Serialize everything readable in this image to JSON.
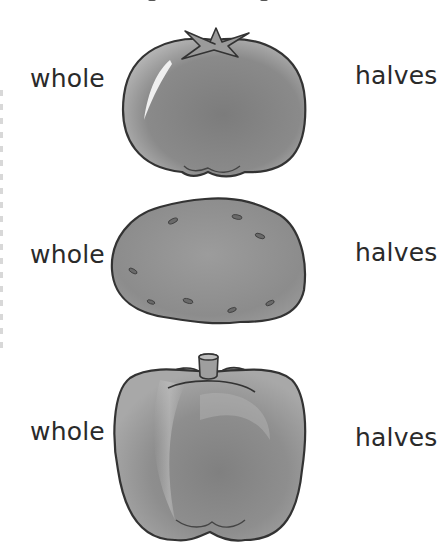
{
  "worksheet": {
    "rows": [
      {
        "item": "tomato",
        "left_label": "whole",
        "right_label": "halves"
      },
      {
        "item": "potato",
        "left_label": "whole",
        "right_label": "halves"
      },
      {
        "item": "bell-pepper",
        "left_label": "whole",
        "right_label": "halves"
      }
    ],
    "colors": {
      "background": "#ffffff",
      "text": "#2a2a2a",
      "outline": "#3a3a3a",
      "fill_dark": "#7a7a7a",
      "fill_light": "#bdbdbd"
    }
  }
}
